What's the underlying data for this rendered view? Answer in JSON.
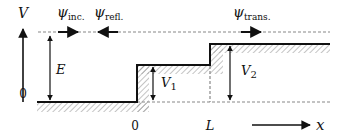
{
  "diagram": {
    "axis": {
      "vertical_label": "V",
      "vertical_zero": "0",
      "horizontal_label": "x",
      "x_origin": "0",
      "x_L": "L"
    },
    "energy": {
      "label": "E"
    },
    "potentials": [
      {
        "label": "V",
        "subscript": "1"
      },
      {
        "label": "V",
        "subscript": "2"
      }
    ],
    "waves": {
      "incident": {
        "symbol": "ψ",
        "subscript": "inc.",
        "direction": "right"
      },
      "reflected": {
        "symbol": "ψ",
        "subscript": "refl.",
        "direction": "left"
      },
      "transmitted": {
        "symbol": "ψ",
        "subscript": "trans.",
        "direction": "right"
      }
    },
    "colors": {
      "line": "#111111",
      "dashed": "#888888",
      "hatch": "#999999"
    }
  }
}
